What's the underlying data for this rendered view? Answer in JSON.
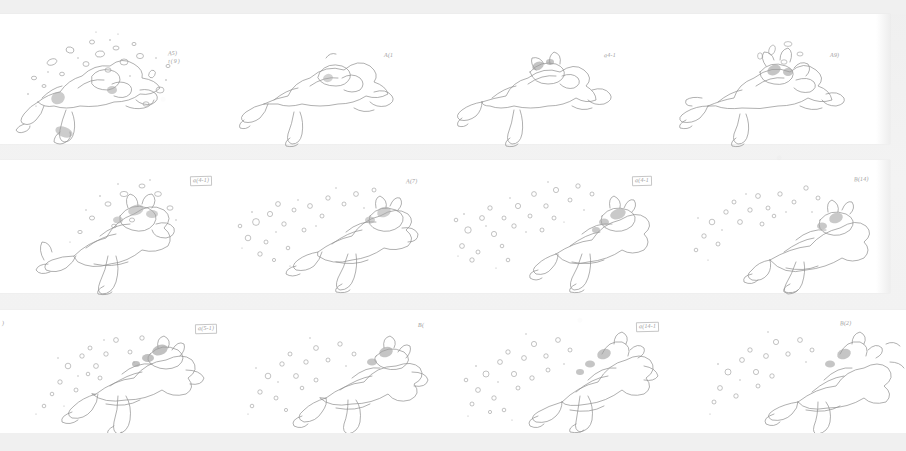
{
  "sheet": {
    "title": "Hand-drawn animation frame contact sheet",
    "background_color": "#f1f1f1",
    "paper_color": "#ffffff",
    "ink_color": "#8a8a8a",
    "rows": 3,
    "frames_per_row": 4,
    "total_frames": 12,
    "medium": "graphite pencil on paper, scanned"
  },
  "rows": [
    {
      "row_label": "row-1",
      "frames": [
        {
          "frame_label": "frame-1",
          "subject": "prone figure with scattered debris and splash particles",
          "annotation": "A5)",
          "annotation_sub": "t(9)",
          "annotation_visible": true
        },
        {
          "frame_label": "frame-2",
          "subject": "prone figure, clean outline, arms extended",
          "annotation": "A(1",
          "annotation_sub": "",
          "annotation_visible": true
        },
        {
          "frame_label": "frame-3",
          "subject": "prone figure with small head detail and limbs",
          "annotation": "a4-1",
          "annotation_sub": "",
          "annotation_visible": true
        },
        {
          "frame_label": "frame-4",
          "subject": "prone figure with burst of splash at head and extended limbs",
          "annotation": "A9)",
          "annotation_sub": "",
          "annotation_visible": true
        }
      ]
    },
    {
      "row_label": "row-2",
      "frames": [
        {
          "frame_label": "frame-5",
          "subject": "figure curled with dense textured debris cluster across body",
          "annotation": "a(4-1)",
          "annotation_sub": "",
          "annotation_visible": true
        },
        {
          "frame_label": "frame-6",
          "subject": "figure with scattered round droplets rising to the left",
          "annotation": "A(7)",
          "annotation_sub": "",
          "annotation_visible": true
        },
        {
          "frame_label": "frame-7",
          "subject": "figure with wide field of small bubbles spreading left",
          "annotation": "a(4-1",
          "annotation_sub": "",
          "annotation_visible": true
        },
        {
          "frame_label": "frame-8",
          "subject": "figure lying flat with sparse droplets above",
          "annotation": "B(14)",
          "annotation_sub": "",
          "annotation_visible": true
        }
      ]
    },
    {
      "row_label": "row-3",
      "frames": [
        {
          "frame_label": "frame-9",
          "subject": "figure rolling with dense splash cluster at left shoulder",
          "annotation": "a(5-1)",
          "annotation_sub": "",
          "annotation_visible": true,
          "edge_annotation": ")"
        },
        {
          "frame_label": "frame-10",
          "subject": "figure with upward splash, scattered bubbles",
          "annotation": "B(",
          "annotation_sub": "",
          "annotation_visible": true
        },
        {
          "frame_label": "frame-11",
          "subject": "figure seated/bent with heavy left-side splash field",
          "annotation": "a(14-1",
          "annotation_sub": "",
          "annotation_visible": true
        },
        {
          "frame_label": "frame-12",
          "subject": "figure partially cropped at right edge with splash trail",
          "annotation": "B(2)",
          "annotation_sub": "",
          "annotation_visible": true
        }
      ]
    }
  ]
}
